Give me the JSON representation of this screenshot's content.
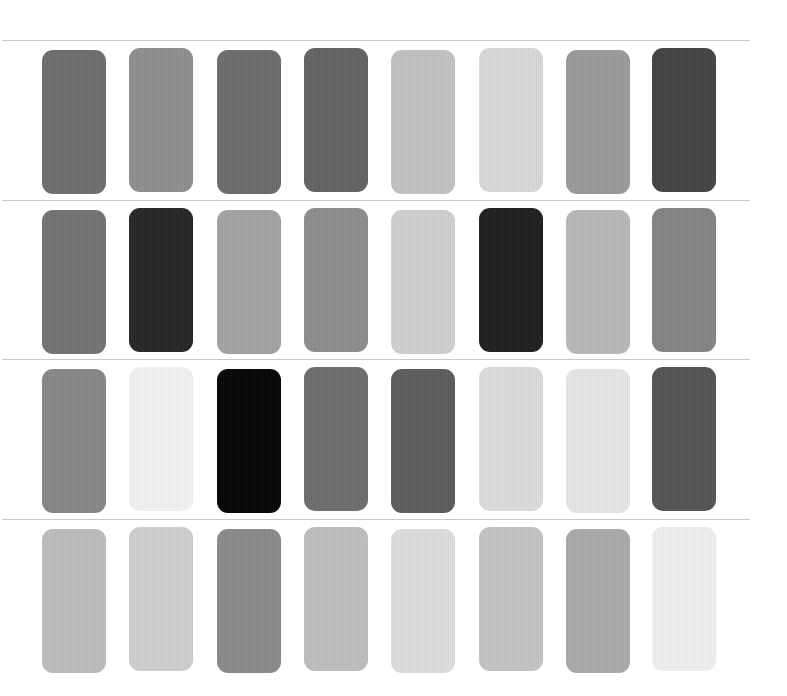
{
  "swatch_grid": {
    "rows": [
      {
        "swatches": [
          "#6e6e6e",
          "#8f8f8f",
          "#6c6c6c",
          "#646464",
          "#c2c2c2",
          "#d9d9d9",
          "#9a9a9a",
          "#444444"
        ]
      },
      {
        "swatches": [
          "#737373",
          "#262626",
          "#a3a3a3",
          "#8e8e8e",
          "#d0d0d0",
          "#1f1f1f",
          "#b9b9b9",
          "#848484"
        ]
      },
      {
        "swatches": [
          "#888888",
          "#f2f2f2",
          "#050505",
          "#6e6e6e",
          "#5c5c5c",
          "#dcdcdc",
          "#e6e6e6",
          "#545454"
        ]
      },
      {
        "swatches": [
          "#bdbdbd",
          "#cfcfcf",
          "#8a8a8a",
          "#bebebe",
          "#dedede",
          "#c4c4c4",
          "#aaaaaa",
          "#efefef"
        ]
      }
    ]
  }
}
